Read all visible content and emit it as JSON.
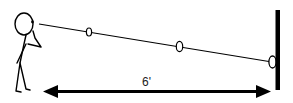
{
  "diagram": {
    "distance_label": "6'",
    "elements": {
      "figure": "stick-figure-person",
      "sight_line": "eye-to-wall line",
      "markers": [
        "ring-marker-1",
        "ring-marker-2",
        "ring-marker-3"
      ],
      "wall": "vertical-wall",
      "measurement_arrow": "double-headed-arrow"
    },
    "colors": {
      "ink": "#000000",
      "background": "#ffffff"
    }
  }
}
